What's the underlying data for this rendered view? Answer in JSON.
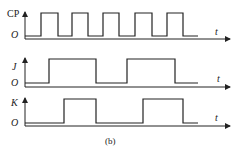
{
  "figure": {
    "caption": "(b)",
    "signals": [
      {
        "name": "CP",
        "origin_label": "O",
        "time_label": "t"
      },
      {
        "name": "J",
        "origin_label": "O",
        "time_label": "t"
      },
      {
        "name": "K",
        "origin_label": "O",
        "time_label": "t"
      }
    ]
  },
  "colors": {
    "line": "#222222",
    "background": "#ffffff"
  },
  "waveforms": {
    "CP": {
      "high_intervals": [
        [
          41,
          58
        ],
        [
          72,
          88
        ],
        [
          103,
          119
        ],
        [
          135,
          152
        ],
        [
          167,
          183
        ]
      ]
    },
    "J": {
      "high_intervals": [
        [
          49,
          96
        ],
        [
          127,
          175
        ]
      ]
    },
    "K": {
      "high_intervals": [
        [
          64,
          96
        ],
        [
          143,
          183
        ]
      ]
    }
  }
}
